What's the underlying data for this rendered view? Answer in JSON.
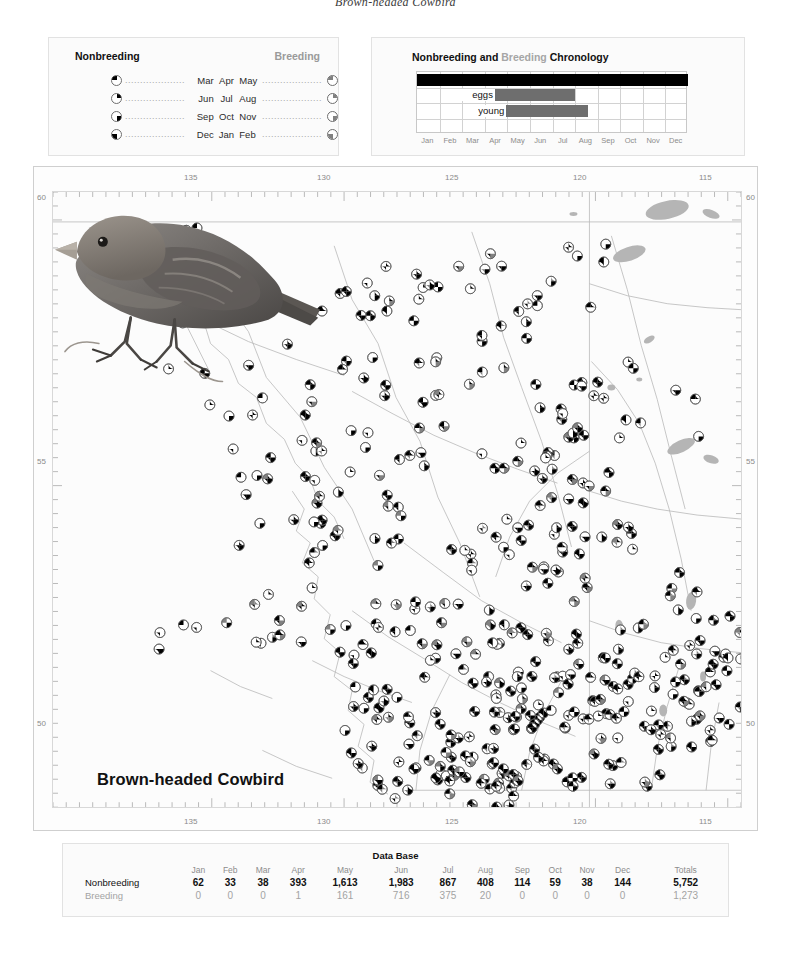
{
  "running_head": "Brown-headed Cowbird",
  "species": {
    "common_name": "Brown-headed Cowbird"
  },
  "season_legend": {
    "heading_nonbreeding": "Nonbreeding",
    "heading_breeding": "Breeding",
    "rows": [
      {
        "left_pie": "top-left",
        "left_month": "Mar",
        "mid_month": "Apr",
        "right_month": "May",
        "right_pie": "top-left",
        "dots": "...................."
      },
      {
        "left_pie": "top-right",
        "left_month": "Jun",
        "mid_month": "Jul",
        "right_month": "Aug",
        "right_pie": "top-right",
        "dots": "...................."
      },
      {
        "left_pie": "bottom-right",
        "left_month": "Sep",
        "mid_month": "Oct",
        "right_month": "Nov",
        "right_pie": "bottom-right",
        "dots": "...................."
      },
      {
        "left_pie": "bottom-left",
        "left_month": "Dec",
        "mid_month": "Jan",
        "right_month": "Feb",
        "right_pie": "bottom-left",
        "dots": "...................."
      }
    ]
  },
  "chronology": {
    "title_part1": "Nonbreeding and ",
    "title_breeding": "Breeding",
    "title_part2": " Chronology",
    "months": [
      "Jan",
      "Feb",
      "Mar",
      "Apr",
      "May",
      "Jun",
      "Jul",
      "Aug",
      "Sep",
      "Oct",
      "Nov",
      "Dec"
    ],
    "label_eggs": "eggs",
    "label_young": "young",
    "bars": [
      {
        "name": "presence",
        "start_month": 0.0,
        "end_month": 12.0,
        "color": "#000000",
        "row": 1
      },
      {
        "name": "eggs",
        "start_month": 3.45,
        "end_month": 7.0,
        "color": "#6e6e6e",
        "row": 2
      },
      {
        "name": "young",
        "start_month": 3.95,
        "end_month": 7.55,
        "color": "#6e6e6e",
        "row": 3
      }
    ]
  },
  "map": {
    "longitude_labels": [
      "135",
      "130",
      "125",
      "120",
      "115"
    ],
    "latitude_labels": [
      "60",
      "55",
      "50"
    ],
    "bird_label": "Brown-headed Cowbird"
  },
  "chart_data": {
    "type": "table",
    "title": "Data Base",
    "categories": [
      "Jan",
      "Feb",
      "Mar",
      "Apr",
      "May",
      "Jun",
      "Jul",
      "Aug",
      "Sep",
      "Oct",
      "Nov",
      "Dec"
    ],
    "totals_header": "Totals",
    "series": [
      {
        "name": "Nonbreeding",
        "values": [
          62,
          33,
          38,
          393,
          1613,
          1983,
          867,
          408,
          114,
          59,
          38,
          144
        ],
        "display_values": [
          "62",
          "33",
          "38",
          "393",
          "1,613",
          "1,983",
          "867",
          "408",
          "114",
          "59",
          "38",
          "144"
        ],
        "total": 5752,
        "total_display": "5,752",
        "color": "#111111"
      },
      {
        "name": "Breeding",
        "values": [
          0,
          0,
          0,
          1,
          161,
          716,
          375,
          20,
          0,
          0,
          0,
          0
        ],
        "display_values": [
          "0",
          "0",
          "0",
          "1",
          "161",
          "716",
          "375",
          "20",
          "0",
          "0",
          "0",
          "0"
        ],
        "total": 1273,
        "total_display": "1,273",
        "color": "#a3a3a3"
      }
    ],
    "xlabel": "",
    "ylabel": "Records",
    "grid": false,
    "legend_position": "none"
  }
}
